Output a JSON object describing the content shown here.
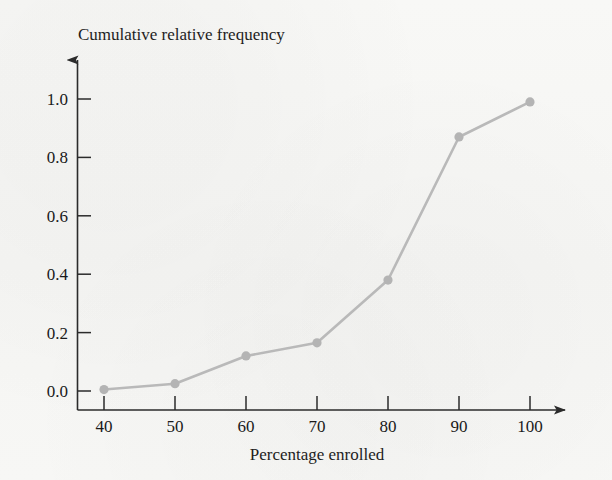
{
  "figure": {
    "background_color": "#f7f7f5",
    "axis_color": "#2b2b2b",
    "text_color": "#1a1a1a"
  },
  "chart_data": {
    "type": "line",
    "title": "",
    "ylabel": "Cumulative relative frequency",
    "xlabel": "Percentage enrolled",
    "x": [
      40,
      50,
      60,
      70,
      80,
      90,
      100
    ],
    "values": [
      0.005,
      0.025,
      0.12,
      0.165,
      0.38,
      0.87,
      0.99
    ],
    "series": [
      {
        "name": "Cumulative relative frequency",
        "values": [
          0.005,
          0.025,
          0.12,
          0.165,
          0.38,
          0.87,
          0.99
        ]
      }
    ],
    "xlim": [
      36,
      104
    ],
    "ylim": [
      0.0,
      1.1
    ],
    "xticks": [
      40,
      50,
      60,
      70,
      80,
      90,
      100
    ],
    "xticklabels": [
      "40",
      "50",
      "60",
      "70",
      "80",
      "90",
      "100"
    ],
    "yticks": [
      0.0,
      0.2,
      0.4,
      0.6,
      0.8,
      1.0
    ],
    "yticklabels": [
      "0.0",
      "0.2",
      "0.4",
      "0.6",
      "0.8",
      "1.0"
    ],
    "grid": false,
    "legend": false,
    "legend_position": "none",
    "marker": "circle",
    "line_color": "#b9b9b9",
    "marker_color": "#b4b4b4",
    "x_axis_arrow": true,
    "y_axis_arrow": true,
    "annotations": []
  }
}
